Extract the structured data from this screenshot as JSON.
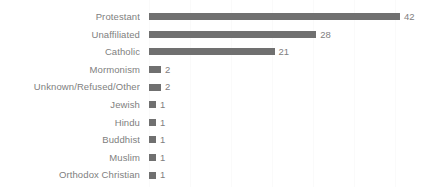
{
  "chart_data": {
    "type": "bar",
    "orientation": "horizontal",
    "title": "",
    "xlabel": "",
    "ylabel": "",
    "xlim": [
      0,
      42
    ],
    "grid": true,
    "legend": false,
    "bar_color": "#707070",
    "label_color": "#808080",
    "background": "#ffffff",
    "categories": [
      "Protestant",
      "Unaffiliated",
      "Catholic",
      "Mormonism",
      "Unknown/Refused/Other",
      "Jewish",
      "Hindu",
      "Buddhist",
      "Muslim",
      "Orthodox Christian"
    ],
    "values": [
      42,
      28,
      21,
      2,
      2,
      1,
      1,
      1,
      1,
      1
    ],
    "data_labels": [
      "42",
      "28",
      "21",
      "2",
      "2",
      "1",
      "1",
      "1",
      "1",
      "1"
    ],
    "bars": [
      {
        "category": "Protestant",
        "value": 42,
        "label": "42"
      },
      {
        "category": "Unaffiliated",
        "value": 28,
        "label": "28"
      },
      {
        "category": "Catholic",
        "value": 21,
        "label": "21"
      },
      {
        "category": "Mormonism",
        "value": 2,
        "label": "2"
      },
      {
        "category": "Unknown/Refused/Other",
        "value": 2,
        "label": "2"
      },
      {
        "category": "Jewish",
        "value": 1,
        "label": "1"
      },
      {
        "category": "Hindu",
        "value": 1,
        "label": "1"
      },
      {
        "category": "Buddhist",
        "value": 1,
        "label": "1"
      },
      {
        "category": "Muslim",
        "value": 1,
        "label": "1"
      },
      {
        "category": "Orthodox Christian",
        "value": 1,
        "label": "1"
      }
    ]
  }
}
